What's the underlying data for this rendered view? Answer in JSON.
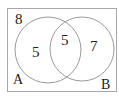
{
  "diagram": {
    "type": "venn",
    "universal_count": "8",
    "sets": [
      {
        "label": "A",
        "only_count": "5"
      },
      {
        "label": "B",
        "only_count": "7"
      }
    ],
    "intersection_count": "5",
    "colors": {
      "stroke": "#9a9a9a",
      "text": "#222222",
      "background": "#ffffff"
    }
  }
}
